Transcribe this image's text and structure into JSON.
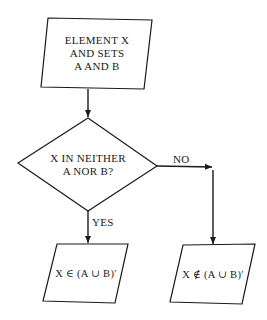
{
  "nodes": {
    "start": {
      "type": "input-output",
      "lines": [
        "ELEMENT X",
        "AND SETS",
        "A AND B"
      ]
    },
    "decision": {
      "type": "decision",
      "lines": [
        "X IN NEITHER",
        "A NOR B?"
      ]
    },
    "yes_result": {
      "type": "input-output",
      "text": "X ∈ (A ∪ B)′"
    },
    "no_result": {
      "type": "input-output",
      "text": "X ∉ (A ∪ B)′"
    }
  },
  "edges": {
    "start_to_decision": {
      "label": ""
    },
    "decision_yes": {
      "label": "YES"
    },
    "decision_no": {
      "label": "NO"
    }
  },
  "colors": {
    "stroke": "#1a1a1a",
    "background": "#ffffff"
  }
}
